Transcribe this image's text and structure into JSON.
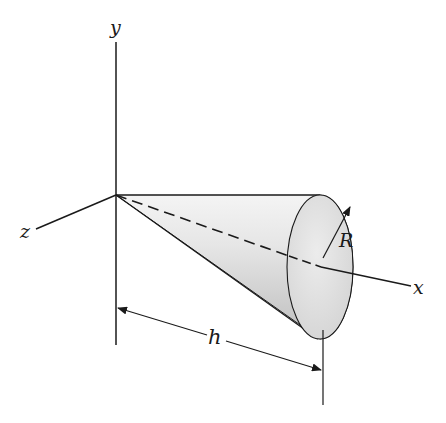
{
  "figure": {
    "type": "cone-on-axes",
    "labels": {
      "y_axis": "y",
      "z_axis": "z",
      "x_axis": "x",
      "radius": "R",
      "height": "h"
    },
    "colors": {
      "line": "#1a1a1a",
      "cone_light": "#f2f2f2",
      "cone_mid": "#d4d4d4",
      "cone_dark": "#bdbdbd",
      "base_fill": "#e2e2e2"
    }
  }
}
